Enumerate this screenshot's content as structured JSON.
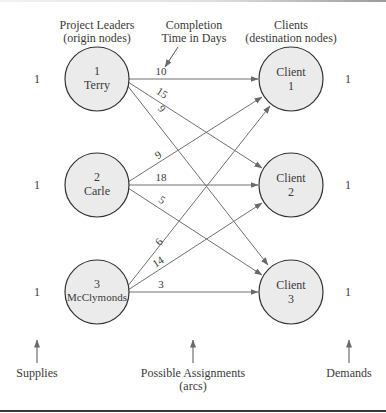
{
  "headers": {
    "origins_line1": "Project Leaders",
    "origins_line2": "(origin nodes)",
    "times_line1": "Completion",
    "times_line2": "Time in Days",
    "destinations_line1": "Clients",
    "destinations_line2": "(destination nodes)"
  },
  "origins": [
    {
      "number": "1",
      "name": "Terry",
      "supply": "1"
    },
    {
      "number": "2",
      "name": "Carle",
      "supply": "1"
    },
    {
      "number": "3",
      "name": "McClymonds",
      "supply": "1"
    }
  ],
  "destinations": [
    {
      "label": "Client",
      "number": "1",
      "demand": "1"
    },
    {
      "label": "Client",
      "number": "2",
      "demand": "1"
    },
    {
      "label": "Client",
      "number": "3",
      "demand": "1"
    }
  ],
  "arcs": [
    {
      "from": "1",
      "to": "1",
      "time": "10"
    },
    {
      "from": "1",
      "to": "2",
      "time": "15"
    },
    {
      "from": "1",
      "to": "3",
      "time": "9"
    },
    {
      "from": "2",
      "to": "1",
      "time": "9"
    },
    {
      "from": "2",
      "to": "2",
      "time": "18"
    },
    {
      "from": "2",
      "to": "3",
      "time": "5"
    },
    {
      "from": "3",
      "to": "1",
      "time": "6"
    },
    {
      "from": "3",
      "to": "2",
      "time": "14"
    },
    {
      "from": "3",
      "to": "3",
      "time": "3"
    }
  ],
  "footer": {
    "supplies": "Supplies",
    "assignments_line1": "Possible Assignments",
    "assignments_line2": "(arcs)",
    "demands": "Demands"
  },
  "colors": {
    "node_fill": "#ebebeb",
    "node_stroke": "#333333",
    "arc": "#707070",
    "text": "#3a3a3a"
  }
}
